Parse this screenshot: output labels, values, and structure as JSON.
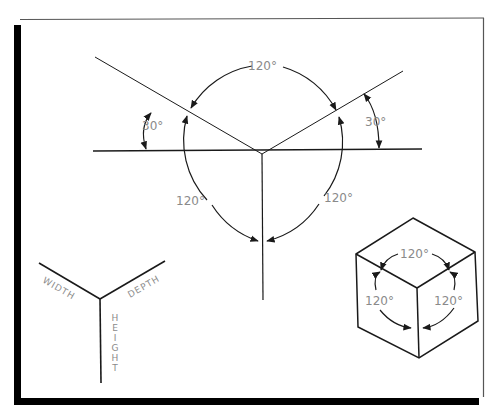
{
  "figure": {
    "frame": {
      "border_color": "#555555",
      "shadow_color": "#000000",
      "background": "#ffffff"
    },
    "main_construction": {
      "labels": {
        "top_arc": "120°",
        "left_arc": "120°",
        "right_arc": "120°",
        "left_incline": "30°",
        "right_incline": "30°"
      }
    },
    "axis_labels": {
      "width": "WIDTH",
      "depth": "DEPTH",
      "height": "HEIGHT"
    },
    "cube": {
      "labels": {
        "top": "120°",
        "left": "120°",
        "right": "120°"
      }
    },
    "colors": {
      "line": "#1a1a1a",
      "label": "#8a8a8a"
    }
  }
}
